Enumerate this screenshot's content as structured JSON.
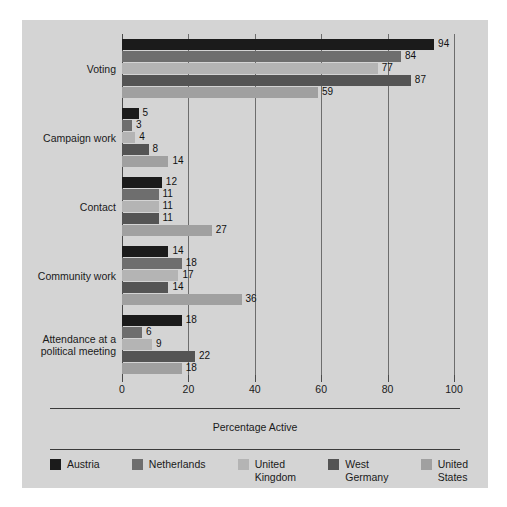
{
  "chart_data": {
    "type": "bar",
    "orientation": "horizontal",
    "title": "",
    "xlabel": "Percentage Active",
    "ylabel": "",
    "xlim": [
      0,
      100
    ],
    "xticks": [
      0,
      20,
      40,
      60,
      80,
      100
    ],
    "xtick_labels": [
      "0",
      "20",
      "40",
      "60",
      "80",
      "100"
    ],
    "grid": "vertical",
    "legend_position": "bottom",
    "categories": [
      "Voting",
      "Campaign work",
      "Contact",
      "Community work",
      "Attendance at a\npolitical meeting"
    ],
    "series": [
      {
        "name": "Austria",
        "color": "#1b1b1b",
        "values": [
          94,
          5,
          12,
          14,
          18
        ]
      },
      {
        "name": "Netherlands",
        "color": "#6e6e6e",
        "values": [
          84,
          3,
          11,
          18,
          6
        ]
      },
      {
        "name": "United\nKingdom",
        "color": "#b4b4b4",
        "values": [
          77,
          4,
          11,
          17,
          9
        ]
      },
      {
        "name": "West\nGermany",
        "color": "#545454",
        "values": [
          87,
          8,
          11,
          14,
          22
        ]
      },
      {
        "name": "United\nStates",
        "color": "#a0a0a0",
        "values": [
          59,
          14,
          27,
          36,
          18
        ]
      }
    ],
    "value_labels": [
      [
        "94",
        "84",
        "77",
        "87",
        "59"
      ],
      [
        "5",
        "3",
        "4",
        "8",
        "14"
      ],
      [
        "12",
        "11",
        "11",
        "11",
        "27"
      ],
      [
        "14",
        "18",
        "17",
        "14",
        "36"
      ],
      [
        "18",
        "6",
        "9",
        "22",
        "18"
      ]
    ]
  },
  "legend": {
    "items": [
      {
        "label": "Austria"
      },
      {
        "label": "Netherlands"
      },
      {
        "label": "United\nKingdom"
      },
      {
        "label": "West\nGermany"
      },
      {
        "label": "United\nStates"
      }
    ]
  },
  "colors": {
    "panel_background": "#d4d4d4",
    "page_background": "#ffffff",
    "axis": "#4a4a4a",
    "gridline": "#6d6d6d",
    "text": "#1a1a1a"
  }
}
